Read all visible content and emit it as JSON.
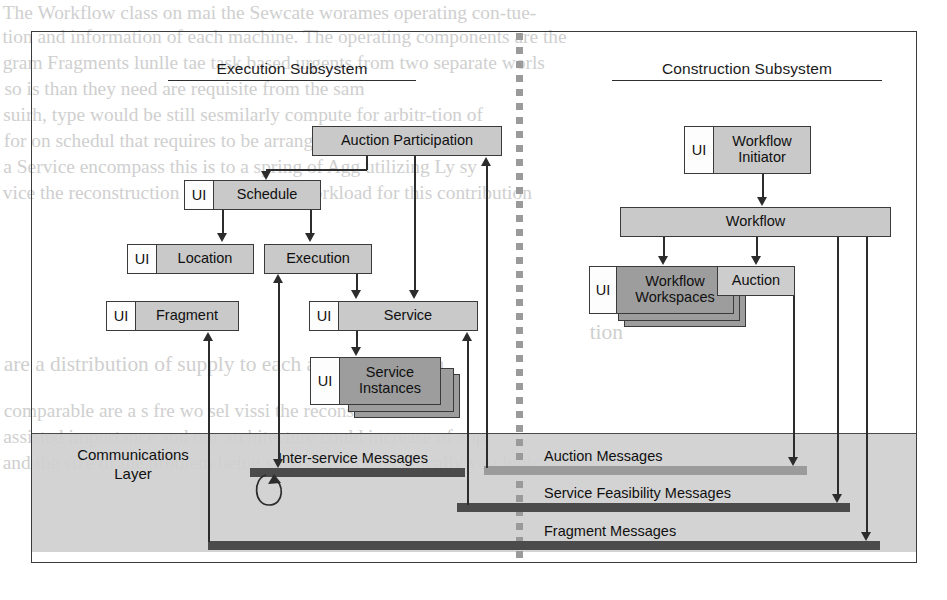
{
  "figure": {
    "frame_border_color": "#3a3a3a",
    "box_fill": "#c9c9c9",
    "box_fill_dark": "#9d9d9d",
    "bar_dark": "#4b4b4b",
    "bar_gray": "#9b9b9b",
    "comm_band": "#cfcfcf"
  },
  "subsystems": {
    "left": {
      "title": "Execution Subsystem"
    },
    "right": {
      "title": "Construction Subsystem"
    }
  },
  "ui_tag": "UI",
  "execution": {
    "auction_participation": "Auction Participation",
    "schedule": "Schedule",
    "location": "Location",
    "execution": "Execution",
    "fragment": "Fragment",
    "service": "Service",
    "service_instances": "Service\nInstances",
    "service_instances_line1": "Service",
    "service_instances_line2": "Instances"
  },
  "construction": {
    "workflow_initiator_line1": "Workflow",
    "workflow_initiator_line2": "Initiator",
    "workflow": "Workflow",
    "workflow_workspaces_line1": "Workflow",
    "workflow_workspaces_line2": "Workspaces",
    "auction": "Auction"
  },
  "communications": {
    "title_line1": "Communications",
    "title_line2": "Layer",
    "buses": [
      {
        "label": "Inter-service Messages",
        "style": "dark"
      },
      {
        "label": "Auction Messages",
        "style": "gray"
      },
      {
        "label": "Service Feasibility Messages",
        "style": "dark"
      },
      {
        "label": "Fragment Messages",
        "style": "dark"
      }
    ]
  },
  "page_bleed": {
    "lines": [
      "The Workflow class on mai the  Sewcate worames   operating con-tue-",
      "tion and   information  of each machine.  The operating components  are the",
      "gram  Fragments  lunlle tae task based  urgents  from  two  separate   worls",
      "so  is  than  they   need  are   requisite  from  the  sam",
      "suirh,    type  would   be  still  sesmilarly compute  for  arbitr-tion  of",
      "for  on    schedul  that  requires   to be  arranged  by  the   or  ase",
      "a  Service  encompass  this  is  to  a  spring   of  Agg  utilizing  Ly  sy",
      "vice   the  reconstruction  in  the  reduced  workload  for  this  contribution",
      "tion",
      "are  a distribution of  supply  to  each  agent  on  system",
      "comparable  are  a  s  fre  wo  sel  vissi  the  reconstruction  on",
      "assisted  importance  and  our  architecture  could  increase  of  app",
      "and  the  size  of the problem being solved,  which  technically  you  logic"
    ]
  }
}
